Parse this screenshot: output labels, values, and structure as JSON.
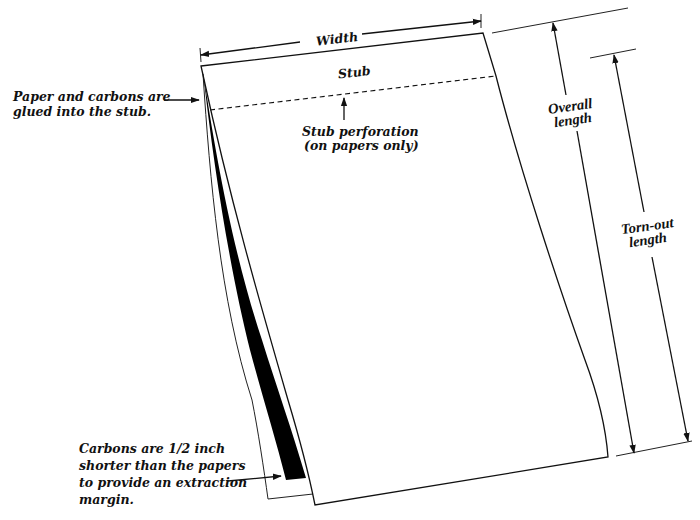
{
  "diagram": {
    "labels": {
      "width": "Width",
      "stub": "Stub",
      "stub_perforation_line1": "Stub perforation",
      "stub_perforation_line2": "(on papers only)",
      "glued_line1": "Paper and carbons are",
      "glued_line2": "glued into the stub.",
      "overall_line1": "Overall",
      "overall_line2": "length",
      "tornout_line1": "Torn-out",
      "tornout_line2": "length",
      "carbons_line1": "Carbons are 1/2 inch",
      "carbons_line2": "shorter than the papers",
      "carbons_line3": "to provide an extraction",
      "carbons_line4": "margin."
    },
    "colors": {
      "ink": "#111111",
      "carbon": "#000000",
      "paper": "#ffffff"
    }
  }
}
